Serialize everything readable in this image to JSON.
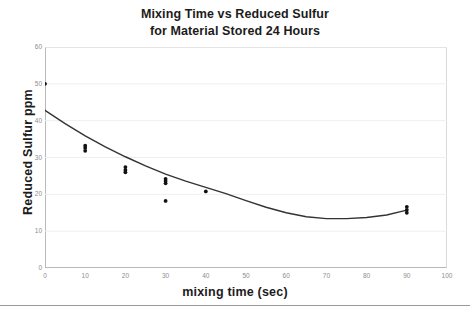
{
  "chart_data": {
    "type": "scatter",
    "title": "Mixing Time vs Reduced Sulfur for Material Stored 24 Hours",
    "title_lines": [
      "Mixing Time vs Reduced Sulfur",
      "for Material Stored 24 Hours"
    ],
    "xlabel": "mixing time (sec)",
    "ylabel": "Reduced Sulfur ppm",
    "xlim": [
      0,
      100
    ],
    "ylim": [
      0,
      60
    ],
    "xticks": [
      0,
      10,
      20,
      30,
      40,
      50,
      60,
      70,
      80,
      90,
      100
    ],
    "yticks": [
      0,
      10,
      20,
      30,
      40,
      50,
      60
    ],
    "grid": "horizontal-light",
    "legend": "none",
    "marker_color": "#111111",
    "line_color": "#333333",
    "points": [
      {
        "x": 0,
        "y": 50.0
      },
      {
        "x": 10,
        "y": 33.2
      },
      {
        "x": 10,
        "y": 32.6
      },
      {
        "x": 10,
        "y": 31.8
      },
      {
        "x": 20,
        "y": 27.4
      },
      {
        "x": 20,
        "y": 26.6
      },
      {
        "x": 20,
        "y": 26.0
      },
      {
        "x": 30,
        "y": 24.2
      },
      {
        "x": 30,
        "y": 23.6
      },
      {
        "x": 30,
        "y": 23.0
      },
      {
        "x": 30,
        "y": 18.2
      },
      {
        "x": 40,
        "y": 20.8
      },
      {
        "x": 90,
        "y": 16.6
      },
      {
        "x": 90,
        "y": 15.8
      },
      {
        "x": 90,
        "y": 15.0
      }
    ],
    "fit_curve": {
      "label": "quadratic trend line",
      "x": [
        0,
        5,
        10,
        15,
        20,
        25,
        30,
        35,
        40,
        45,
        50,
        55,
        60,
        65,
        70,
        75,
        80,
        85,
        90
      ],
      "y": [
        42.8,
        39.2,
        35.9,
        32.9,
        30.2,
        27.7,
        25.5,
        23.6,
        21.9,
        20.2,
        18.3,
        16.5,
        15.0,
        13.9,
        13.4,
        13.4,
        13.7,
        14.4,
        15.7
      ]
    }
  }
}
